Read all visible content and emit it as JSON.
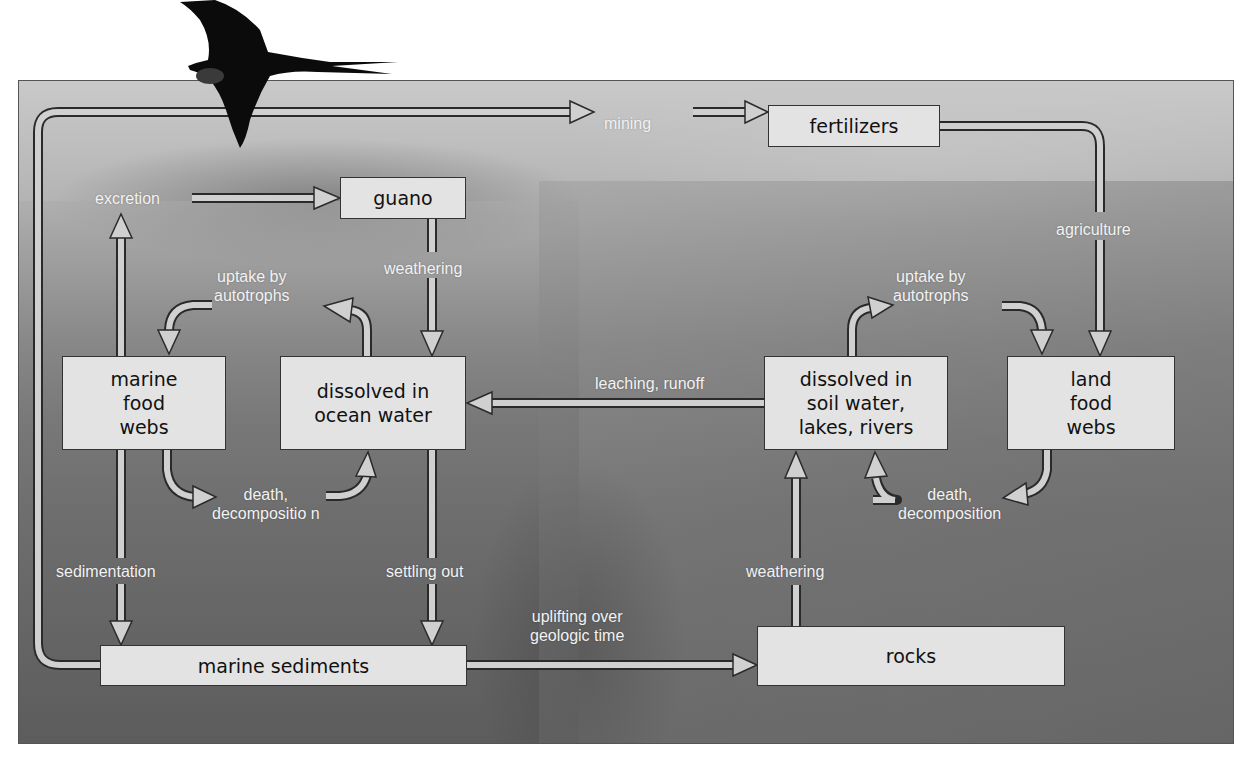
{
  "diagram": {
    "colors": {
      "box_fill": "#e3e3e3",
      "box_border": "#333333",
      "arrow_fill": "#d0d0d0",
      "arrow_stroke": "#2a2a2a",
      "label_text": "#f2f2f2"
    },
    "nodes": {
      "fertilizers": "fertilizers",
      "guano": "guano",
      "marine_food_webs": [
        "marine",
        "food",
        "webs"
      ],
      "dissolved_ocean": [
        "dissolved in",
        "ocean water"
      ],
      "dissolved_soil": [
        "dissolved in",
        "soil water,",
        "lakes, rivers"
      ],
      "land_food_webs": [
        "land",
        "food",
        "webs"
      ],
      "marine_sediments": "marine sediments",
      "rocks": "rocks"
    },
    "process_labels": {
      "mining": "mining",
      "excretion": "excretion",
      "agriculture": "agriculture",
      "weathering_guano": "weathering",
      "uptake_marine": [
        "uptake by",
        "autotrophs"
      ],
      "uptake_land": [
        "uptake by",
        "autotrophs"
      ],
      "leaching_runoff": "leaching, runoff",
      "death_marine": [
        "death,",
        "decompositio n"
      ],
      "death_land": [
        "death,",
        "decomposition"
      ],
      "sedimentation": "sedimentation",
      "settling_out": "settling out",
      "weathering_rocks": "weathering",
      "uplifting": [
        "uplifting over",
        "geologic time"
      ]
    },
    "edges": [
      {
        "from": "marine sediments",
        "to": "fertilizers",
        "label": "mining"
      },
      {
        "from": "marine food webs",
        "to": "guano",
        "label": "excretion"
      },
      {
        "from": "guano",
        "to": "dissolved in ocean water",
        "label": "weathering"
      },
      {
        "from": "fertilizers",
        "to": "land food webs",
        "label": "agriculture"
      },
      {
        "from": "dissolved in ocean water",
        "to": "marine food webs",
        "label": "uptake by autotrophs"
      },
      {
        "from": "marine food webs",
        "to": "dissolved in ocean water",
        "label": "death, decomposition"
      },
      {
        "from": "dissolved in soil water, lakes, rivers",
        "to": "dissolved in ocean water",
        "label": "leaching, runoff"
      },
      {
        "from": "dissolved in soil water, lakes, rivers",
        "to": "land food webs",
        "label": "uptake by autotrophs"
      },
      {
        "from": "land food webs",
        "to": "dissolved in soil water, lakes, rivers",
        "label": "death, decomposition"
      },
      {
        "from": "marine food webs",
        "to": "marine sediments",
        "label": "sedimentation"
      },
      {
        "from": "dissolved in ocean water",
        "to": "marine sediments",
        "label": "settling out"
      },
      {
        "from": "rocks",
        "to": "dissolved in soil water, lakes, rivers",
        "label": "weathering"
      },
      {
        "from": "marine sediments",
        "to": "rocks",
        "label": "uplifting over geologic time"
      }
    ]
  }
}
